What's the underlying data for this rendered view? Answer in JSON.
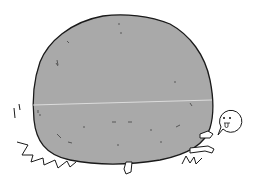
{
  "illustration": {
    "subject": "boulder-crushing-person",
    "colors": {
      "background": "#ffffff",
      "boulder_fill": "#a9a9a9",
      "outline": "#1a1a1a",
      "crack_line": "#e8e8e8",
      "skin": "#ffffff"
    },
    "speech_bubble": {
      "face": "dizzy-face-with-tongue"
    }
  }
}
